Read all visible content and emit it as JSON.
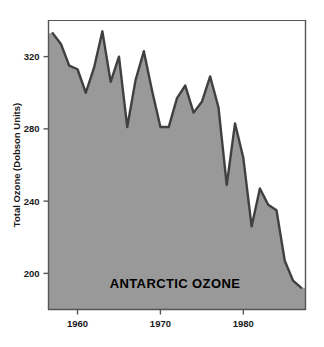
{
  "chart_data": {
    "type": "area",
    "title": "",
    "annotation": "ANTARCTIC OZONE",
    "xlabel": "",
    "ylabel": "Total Ozone (Dobson Units)",
    "xlim": [
      1956.5,
      1987.5
    ],
    "ylim": [
      180,
      340
    ],
    "grid": false,
    "legend": "none",
    "xticks": [
      1960,
      1970,
      1980
    ],
    "xtick_labels": [
      "1960",
      "1970",
      "1980"
    ],
    "yticks": [
      200,
      240,
      280,
      320
    ],
    "ytick_labels": [
      "200",
      "240",
      "280",
      "320"
    ],
    "fill_color": "#999999",
    "line_color": "#404040",
    "axis_color": "#555555",
    "background_color": "#ffffff",
    "x": [
      1957,
      1958,
      1959,
      1960,
      1961,
      1962,
      1963,
      1964,
      1965,
      1966,
      1967,
      1968,
      1969,
      1970,
      1971,
      1972,
      1973,
      1974,
      1975,
      1976,
      1977,
      1978,
      1979,
      1980,
      1981,
      1982,
      1983,
      1984,
      1985,
      1986,
      1987
    ],
    "values": [
      333,
      327,
      315,
      313,
      300,
      314,
      334,
      306,
      320,
      281,
      307,
      323,
      301,
      281,
      281,
      297,
      304,
      289,
      295,
      309,
      292,
      249,
      283,
      264,
      226,
      247,
      238,
      235,
      207,
      196,
      192
    ],
    "series": [
      {
        "name": "Total Ozone",
        "values": [
          333,
          327,
          315,
          313,
          300,
          314,
          334,
          306,
          320,
          281,
          307,
          323,
          301,
          281,
          281,
          297,
          304,
          289,
          295,
          309,
          292,
          249,
          283,
          264,
          226,
          247,
          238,
          235,
          207,
          196,
          192
        ]
      }
    ]
  },
  "axes": {
    "y_axis_title": "Total Ozone (Dobson Units)"
  }
}
